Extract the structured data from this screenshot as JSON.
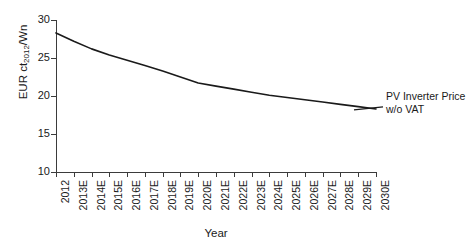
{
  "chart_data": {
    "type": "line",
    "title": "",
    "xlabel": "Year",
    "ylabel": "EUR ct2012/Wn",
    "ylabel_prefix": "EUR ct",
    "ylabel_sub": "2012",
    "ylabel_suffix": "/Wn",
    "xlim": [
      2012,
      2030
    ],
    "ylim": [
      10,
      30
    ],
    "grid": false,
    "legend_position": "inline-right-annotation",
    "categories": [
      "2012",
      "2013E",
      "2014E",
      "2015E",
      "2016E",
      "2017E",
      "2018E",
      "2019E",
      "2020E",
      "2021E",
      "2022E",
      "2023E",
      "2024E",
      "2025E",
      "2026E",
      "2027E",
      "2028E",
      "2029E",
      "2030E"
    ],
    "y_ticks": [
      "10",
      "15",
      "20",
      "25",
      "30"
    ],
    "y_tick_values": [
      10,
      15,
      20,
      25,
      30
    ],
    "series": [
      {
        "name": "PV Inverter Price w/o VAT",
        "annotation_line_1": "PV Inverter Price",
        "annotation_line_2": "w/o VAT",
        "color": "#1a1a1a",
        "values": [
          28.3,
          27.2,
          26.2,
          25.4,
          24.7,
          24.0,
          23.3,
          22.5,
          21.7,
          21.3,
          20.9,
          20.5,
          20.1,
          19.8,
          19.5,
          19.2,
          18.9,
          18.6,
          18.3
        ]
      }
    ]
  },
  "axes": {
    "x_title": "Year"
  },
  "colors": {
    "line": "#1a1a1a",
    "axis": "#3b3b3b",
    "background": "#ffffff"
  }
}
